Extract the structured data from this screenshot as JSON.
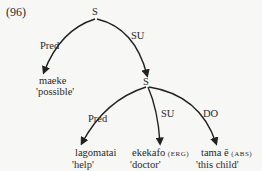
{
  "example_number": "(96)",
  "tree": {
    "root": {
      "label": "S"
    },
    "root_edges": [
      {
        "label": "Pred",
        "target": {
          "word": "maeke",
          "gloss": "'possible'"
        }
      },
      {
        "label": "SU",
        "target": "S"
      }
    ],
    "sub": {
      "label": "S"
    },
    "sub_edges": [
      {
        "label": "Pred",
        "target": {
          "word": "lagomatai",
          "case": "",
          "gloss": "'help'"
        }
      },
      {
        "label": "SU",
        "target": {
          "word": "ekekafo",
          "case": "(ERG)",
          "gloss": "'doctor'"
        }
      },
      {
        "label": "DO",
        "target": {
          "word": "tama ē",
          "case": "(ABS)",
          "gloss": "'this child'"
        }
      }
    ]
  }
}
